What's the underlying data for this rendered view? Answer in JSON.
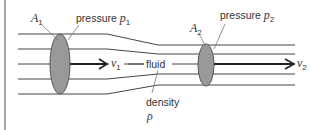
{
  "diagram": {
    "colors": {
      "line": "#444444",
      "ellipse_fill": "#999999",
      "ellipse_stroke": "#555555",
      "text": "#333333",
      "border": "#888888"
    },
    "labels": {
      "area1_symbol": "A",
      "area1_sub": "1",
      "pressure1_word": "pressure",
      "pressure1_symbol": "p",
      "pressure1_sub": "1",
      "area2_symbol": "A",
      "area2_sub": "2",
      "pressure2_word": "pressure",
      "pressure2_symbol": "p",
      "pressure2_sub": "2",
      "velocity1_symbol": "v",
      "velocity1_sub": "1",
      "velocity2_symbol": "v",
      "velocity2_sub": "2",
      "fluid": "fluid",
      "density_word": "density",
      "density_symbol": "ρ"
    }
  }
}
